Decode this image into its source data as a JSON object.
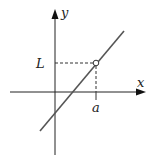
{
  "figure": {
    "labels": {
      "y_axis": "y",
      "x_axis": "x",
      "limit_value": "L",
      "point": "a"
    },
    "colors": {
      "axes": "#222222",
      "line": "#555555",
      "dashes": "#333333",
      "hole_fill": "#ffffff"
    }
  }
}
